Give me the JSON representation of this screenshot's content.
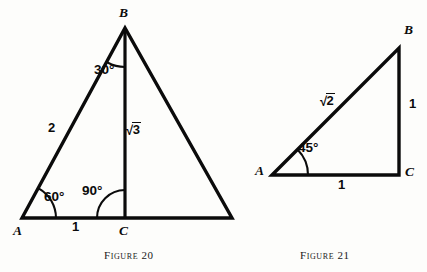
{
  "page": {
    "background_color": "#fdfdfb",
    "ink_color": "#0b0b0b",
    "width": 427,
    "height": 272
  },
  "figures": [
    {
      "id": "figure-20",
      "caption": "Figure 20",
      "caption_label": "Figure",
      "caption_number": "20",
      "description": "Equilateral triangle with altitude from apex B to base point C",
      "vertices": [
        {
          "name": "A",
          "label": "A",
          "x": 22,
          "y": 218
        },
        {
          "name": "B",
          "label": "B",
          "x": 125,
          "y": 28
        },
        {
          "name": "C",
          "label": "C",
          "x": 125,
          "y": 218
        },
        {
          "name": "D",
          "label": "",
          "x": 232,
          "y": 218
        }
      ],
      "side_labels": [
        {
          "name": "side-ab",
          "text": "2",
          "type": "plain",
          "x": 52,
          "y": 128
        },
        {
          "name": "altitude-bc",
          "text": "3",
          "type": "radical",
          "radicand": "3",
          "x": 129,
          "y": 128
        },
        {
          "name": "base-ac",
          "text": "1",
          "type": "plain",
          "x": 74,
          "y": 226
        }
      ],
      "angle_labels": [
        {
          "name": "angle-b",
          "text": "30°",
          "x": 96,
          "y": 70
        },
        {
          "name": "angle-a",
          "text": "60°",
          "x": 46,
          "y": 190
        },
        {
          "name": "angle-c",
          "text": "90°",
          "x": 84,
          "y": 186
        }
      ]
    },
    {
      "id": "figure-21",
      "caption": "Figure 21",
      "caption_label": "Figure",
      "caption_number": "21",
      "description": "Right isosceles 45-45-90 triangle with legs of length 1 and hypotenuse root 2",
      "vertices": [
        {
          "name": "A",
          "label": "A",
          "x": 272,
          "y": 175
        },
        {
          "name": "B",
          "label": "B",
          "x": 399,
          "y": 48
        },
        {
          "name": "C",
          "label": "C",
          "x": 399,
          "y": 175
        }
      ],
      "side_labels": [
        {
          "name": "hypotenuse-ab",
          "text": "2",
          "type": "radical",
          "radicand": "2",
          "x": 303,
          "y": 92
        },
        {
          "name": "leg-bc",
          "text": "1",
          "type": "plain",
          "x": 409,
          "y": 103
        },
        {
          "name": "leg-ac",
          "text": "1",
          "type": "plain",
          "x": 340,
          "y": 182
        }
      ],
      "angle_labels": [
        {
          "name": "angle-a",
          "text": "45°",
          "x": 300,
          "y": 148
        }
      ]
    }
  ],
  "radical_sign": "√"
}
